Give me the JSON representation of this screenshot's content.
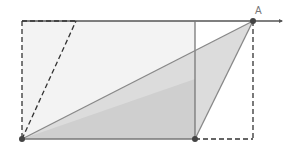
{
  "diagram": {
    "points": {
      "bottom_left": {
        "x": 22,
        "y": 139
      },
      "bottom_mid": {
        "x": 195,
        "y": 139
      },
      "A": {
        "x": 253,
        "y": 21,
        "label": "A"
      },
      "top_left": {
        "x": 22,
        "y": 21
      },
      "top_mid": {
        "x": 195,
        "y": 21
      },
      "dashed_top": {
        "x": 76,
        "y": 21
      },
      "bottom_right": {
        "x": 253,
        "y": 139
      }
    },
    "labels": {
      "point_a": "A"
    },
    "colors": {
      "line": "#777777",
      "dark_line": "#333333",
      "point": "#444444",
      "shade": "#d8d8d8",
      "light_fill": "#f0f0f0"
    }
  }
}
